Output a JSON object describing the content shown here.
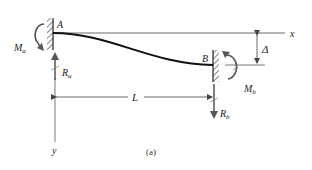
{
  "figure": {
    "caption": "(a)"
  },
  "labels": {
    "support_a": "A",
    "support_b": "B",
    "moment_a": "M",
    "moment_a_sub": "a",
    "moment_b": "M",
    "moment_b_sub": "b",
    "reaction_a": "R",
    "reaction_a_sub": "a",
    "reaction_b": "R",
    "reaction_b_sub": "b",
    "span": "L",
    "displacement": "Δ",
    "x_axis": "x",
    "y_axis": "y"
  },
  "colors": {
    "beam": "#111111",
    "lines": "#444444",
    "arrows": "#555555",
    "text": "#222222",
    "background": "#ffffff"
  }
}
